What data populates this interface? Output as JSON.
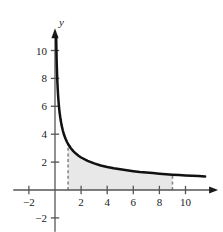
{
  "chart_data": {
    "type": "line",
    "title": "",
    "subtitle": "",
    "xlabel": "",
    "ylabel": "y",
    "y_axis_name": "y",
    "xlim": [
      -3.2,
      12.5
    ],
    "ylim": [
      -3.0,
      11.6
    ],
    "grid": false,
    "legend": null,
    "x_ticks": [
      -2,
      2,
      4,
      6,
      8,
      10
    ],
    "x_tick_labels": [
      "−2",
      "2",
      "4",
      "6",
      "8",
      "10"
    ],
    "y_ticks": [
      -2,
      2,
      4,
      6,
      8,
      10
    ],
    "y_tick_labels": [
      "−2",
      "2",
      "4",
      "6",
      "8",
      "10"
    ],
    "curve": {
      "name": "y = 3.3/sqrt(x)",
      "x": [
        0.09,
        0.11,
        0.13,
        0.15,
        0.18,
        0.21,
        0.25,
        0.3,
        0.36,
        0.43,
        0.5,
        0.6,
        0.7,
        0.8,
        0.9,
        1.0,
        1.2,
        1.4,
        1.6,
        1.8,
        2.0,
        2.5,
        3.0,
        3.5,
        4.0,
        4.5,
        5.0,
        5.5,
        6.0,
        6.5,
        7.0,
        7.5,
        8.0,
        8.5,
        9.0,
        9.5,
        10.0,
        10.5,
        11.0,
        11.5
      ],
      "y": [
        11.0,
        9.95,
        9.15,
        8.52,
        7.78,
        7.2,
        6.6,
        6.02,
        5.5,
        5.03,
        4.67,
        4.26,
        3.94,
        3.69,
        3.48,
        3.3,
        3.01,
        2.79,
        2.61,
        2.46,
        2.33,
        2.09,
        1.91,
        1.76,
        1.65,
        1.56,
        1.48,
        1.41,
        1.35,
        1.29,
        1.25,
        1.21,
        1.17,
        1.13,
        1.1,
        1.07,
        1.04,
        1.02,
        1.0,
        0.97
      ]
    },
    "shaded_region": {
      "label": "area under curve",
      "x_start": 1,
      "x_end": 9,
      "fill_color": "#e8e8e8"
    },
    "dashed_lines": [
      {
        "x": 1,
        "y_top": 3.3
      },
      {
        "x": 9,
        "y_top": 1.1
      }
    ],
    "colors": {
      "curve": "#111111",
      "axis": "#555555",
      "shade": "#e8e8e8",
      "dash": "#888888",
      "text": "#1a1a1a"
    }
  }
}
